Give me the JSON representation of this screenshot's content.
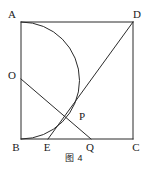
{
  "figure": {
    "caption": "图 4",
    "stroke_color": "#2b2b2b",
    "label_color": "#1a1a1a",
    "background_color": "#ffffff"
  },
  "labels": {
    "a": "A",
    "b": "B",
    "c": "C",
    "d": "D",
    "o": "O",
    "p": "P",
    "e": "E",
    "q": "Q"
  },
  "geometry": {
    "type": "plane-geometry-diagram",
    "shape": "square-with-semicircle",
    "square": {
      "name": "ABCD",
      "vertices": [
        {
          "id": "A",
          "x": 21,
          "y": 22
        },
        {
          "id": "D",
          "x": 133,
          "y": 22
        },
        {
          "id": "C",
          "x": 133,
          "y": 139
        },
        {
          "id": "B",
          "x": 21,
          "y": 139
        }
      ],
      "side_px": 117
    },
    "semicircle": {
      "diameter_endpoints": [
        "A",
        "B"
      ],
      "center": {
        "x": 21,
        "y": 80.5
      },
      "radius_px": 58.5,
      "bulge_direction": "right",
      "rightmost_point": {
        "x": 79.5,
        "y": 80.5
      }
    },
    "points": [
      {
        "id": "O",
        "x": 21,
        "y": 79,
        "on": "side-AB",
        "label_x": 12,
        "label_y": 75
      },
      {
        "id": "E",
        "x": 48,
        "y": 139,
        "on": "side-BC",
        "label_x": 45,
        "label_y": 151
      },
      {
        "id": "Q",
        "x": 91,
        "y": 139,
        "on": "side-BC",
        "label_x": 87,
        "label_y": 151
      },
      {
        "id": "P",
        "x": 72,
        "y": 115,
        "on": "intersection-of-ED-and-OQ",
        "label_x": 76,
        "label_y": 119
      }
    ],
    "segments": [
      {
        "id": "AB",
        "from": "A",
        "to": "B",
        "kind": "square-edge"
      },
      {
        "id": "AD",
        "from": "A",
        "to": "D",
        "kind": "square-edge"
      },
      {
        "id": "DC",
        "from": "D",
        "to": "C",
        "kind": "square-edge"
      },
      {
        "id": "BC",
        "from": "B",
        "to": "C",
        "kind": "square-edge"
      },
      {
        "id": "ED",
        "from": "E",
        "to": "D",
        "kind": "chord"
      },
      {
        "id": "OQ",
        "from": "O",
        "to": "Q",
        "kind": "chord"
      }
    ]
  }
}
